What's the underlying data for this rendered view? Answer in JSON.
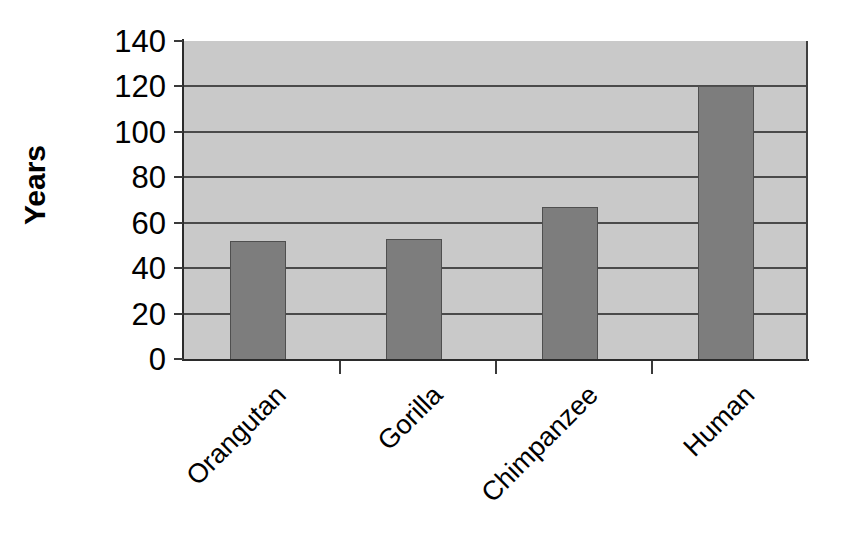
{
  "chart_data": {
    "type": "bar",
    "title": "",
    "xlabel": "",
    "ylabel": "Years",
    "categories": [
      "Orangutan",
      "Gorilla",
      "Chimpanzee",
      "Human"
    ],
    "values": [
      52,
      53,
      67,
      120
    ],
    "ylim": [
      0,
      140
    ],
    "ytick_labels": [
      "0",
      "20",
      "40",
      "60",
      "80",
      "100",
      "120",
      "140"
    ],
    "ytick_values": [
      0,
      20,
      40,
      60,
      80,
      100,
      120,
      140
    ],
    "grid": true,
    "legend": "none",
    "series": [
      {
        "name": "Maximum lifespan",
        "values": [
          52,
          53,
          67,
          120
        ]
      }
    ]
  },
  "style": {
    "plot_background": "#c9c9c9",
    "bar_fill": "#7d7d7d",
    "bar_border": "#4f4f4f",
    "gridline_color": "#4a4a4a",
    "axis_color": "#2b2b2b",
    "text_color": "#000000",
    "page_background": "#ffffff"
  }
}
